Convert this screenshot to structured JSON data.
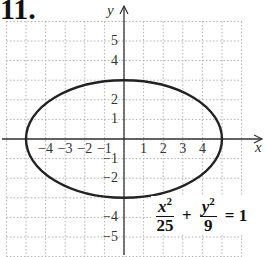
{
  "problem_label": "11.",
  "equation": {
    "term1": {
      "num_var": "x",
      "num_exp": "2",
      "den": "25"
    },
    "plus": "+",
    "term2": {
      "num_var": "y",
      "num_exp": "2",
      "den": "9"
    },
    "equals": "= 1"
  },
  "axes": {
    "x_label": "x",
    "y_label": "y"
  },
  "chart_data": {
    "type": "line",
    "title": "",
    "xlabel": "x",
    "ylabel": "y",
    "xlim": [
      -6,
      6
    ],
    "ylim": [
      -6,
      6
    ],
    "grid": true,
    "x_ticks": [
      -4,
      -3,
      -2,
      -1,
      1,
      2,
      3,
      4
    ],
    "y_ticks": [
      -5,
      -4,
      -2,
      -1,
      1,
      2,
      4,
      5
    ],
    "x_tick_labels": [
      "−4",
      "−3",
      "−2",
      "−1",
      "1",
      "2",
      "3",
      "4"
    ],
    "y_tick_labels": [
      "5",
      "4",
      "2",
      "1",
      "−1",
      "−2",
      "−4",
      "−5"
    ],
    "series": [
      {
        "name": "ellipse",
        "equation": "x^2/25 + y^2/9 = 1",
        "center": [
          0,
          0
        ],
        "semi_major_x": 5,
        "semi_minor_y": 3
      }
    ],
    "annotations": [
      "x²/25 + y²/9 = 1"
    ]
  },
  "colors": {
    "curve": "#222222",
    "axes": "#333333",
    "grid": "#b0b0b0"
  }
}
